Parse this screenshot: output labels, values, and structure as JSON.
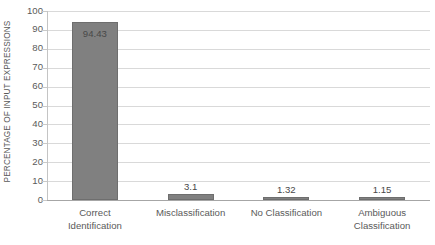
{
  "chart_data": {
    "type": "bar",
    "title": "",
    "subtitle": "",
    "xlabel": "",
    "ylabel": "PERCENTAGE OF INPUT EXPRESSIONS",
    "ylim": [
      0,
      100
    ],
    "ytick_step": 10,
    "yticks": [
      "100",
      "90",
      "80",
      "70",
      "60",
      "50",
      "40",
      "30",
      "20",
      "10",
      "0"
    ],
    "grid": true,
    "legend": false,
    "legend_position": "none",
    "categories": [
      "Correct Identification",
      "Misclassification",
      "No Classification",
      "Ambiguous Classification"
    ],
    "category_lines": [
      [
        "Correct",
        "Identification"
      ],
      [
        "Misclassification"
      ],
      [
        "No Classification"
      ],
      [
        "Ambiguous",
        "Classification"
      ]
    ],
    "values": [
      94.43,
      3.1,
      1.32,
      1.15
    ],
    "value_labels": [
      "94.43",
      "3.1",
      "1.32",
      "1.15"
    ],
    "bar_color": "#808080",
    "bar_border_color": "#6e6e6e",
    "gridline_color": "#d9d9d9",
    "axis_color": "#a6a6a6",
    "text_color": "#5a5a5a",
    "background": "#ffffff"
  }
}
